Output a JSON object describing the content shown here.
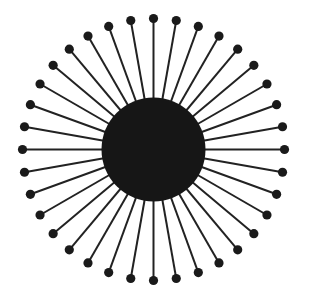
{
  "diagram": {
    "type": "radial-spoke-structure",
    "canvas": {
      "width": 309,
      "height": 295,
      "background": "#ffffff"
    },
    "center": {
      "x": 153.5,
      "y": 149.5
    },
    "core": {
      "radius": 52,
      "color": "#161616"
    },
    "spokes": {
      "count": 36,
      "angle_step_deg": 10,
      "start_angle_deg": 0,
      "outer_radius": 131,
      "line_width": 2,
      "line_color": "#222222",
      "tip_dot_radius": 4.6,
      "tip_dot_color": "#1a1a1a"
    }
  }
}
